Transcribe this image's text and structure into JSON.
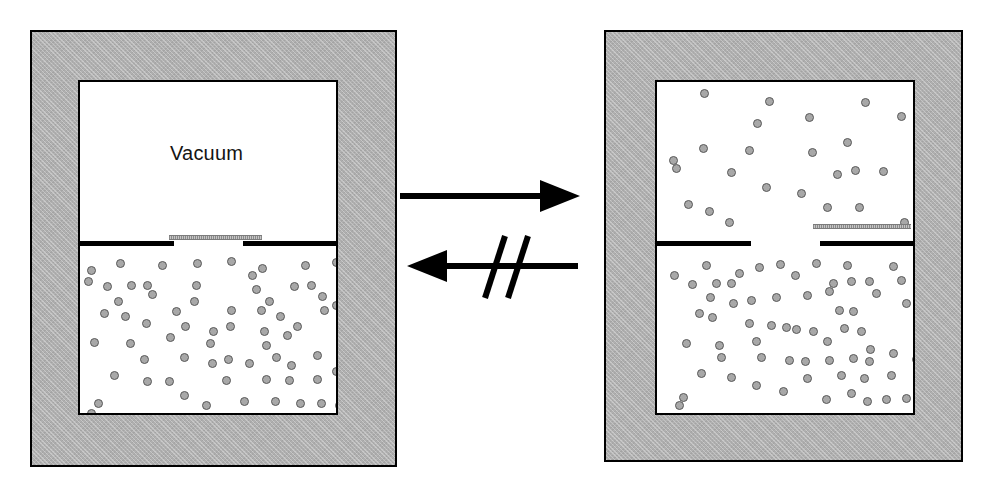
{
  "figure": {
    "width": 992,
    "height": 497,
    "background": "#ffffff"
  },
  "colors": {
    "wall_fill": "#b2b2b2",
    "wall_stroke": "#000000",
    "cavity_fill": "#ffffff",
    "particle_fill": "#a8a8a8",
    "particle_stroke": "#595959",
    "shutter_fill": "#9a9a9a",
    "partition_stroke": "#000000",
    "arrow_color": "#000000",
    "label_color": "#141414"
  },
  "panels": [
    {
      "id": "before",
      "name": "initial-state-vessel",
      "frame": {
        "x": 30,
        "y": 30,
        "w": 367,
        "h": 437
      },
      "cavity": {
        "x": 78,
        "y": 80,
        "w": 260,
        "h": 335
      },
      "partition": {
        "y": 241,
        "left_segment": {
          "x": 78,
          "w": 96
        },
        "right_segment": {
          "x": 243,
          "w": 95
        },
        "gap": {
          "x": 174,
          "w": 69
        }
      },
      "shutter": {
        "x": 169,
        "y": 235,
        "w": 93,
        "state": "closed"
      },
      "upper_chamber": {
        "label": "Vacuum",
        "particle_count": 0
      },
      "lower_chamber": {
        "label": "",
        "particle_count": 66
      },
      "label": {
        "text": "Vacuum",
        "x": 168,
        "y": 140
      }
    },
    {
      "id": "after",
      "name": "final-state-vessel",
      "frame": {
        "x": 604,
        "y": 30,
        "w": 359,
        "h": 432
      },
      "cavity": {
        "x": 655,
        "y": 80,
        "w": 260,
        "h": 335
      },
      "partition": {
        "y": 241,
        "left_segment": {
          "x": 655,
          "w": 96
        },
        "right_segment": {
          "x": 820,
          "w": 95
        },
        "gap": {
          "x": 751,
          "w": 69
        }
      },
      "shutter": {
        "x": 813,
        "y": 224,
        "w": 98,
        "state": "open"
      },
      "upper_chamber": {
        "label": "",
        "particle_count": 25
      },
      "lower_chamber": {
        "label": "",
        "particle_count": 65
      }
    }
  ],
  "arrows": {
    "forward": {
      "name": "forward-process-arrow",
      "label": "",
      "direction": "right",
      "meaning": "spontaneous free expansion"
    },
    "reverse": {
      "name": "reverse-process-arrow",
      "label": "",
      "direction": "left",
      "crossed_out": true,
      "slash_count": 2,
      "meaning": "reverse process does not occur spontaneously"
    }
  },
  "particles": {
    "before_lower": [
      [
        7,
        17
      ],
      [
        36,
        10
      ],
      [
        78,
        12
      ],
      [
        113,
        10
      ],
      [
        147,
        8
      ],
      [
        178,
        15
      ],
      [
        185,
        48
      ],
      [
        221,
        12
      ],
      [
        252,
        9
      ],
      [
        4,
        28
      ],
      [
        23,
        33
      ],
      [
        47,
        32
      ],
      [
        63,
        32
      ],
      [
        112,
        32
      ],
      [
        168,
        22
      ],
      [
        210,
        33
      ],
      [
        227,
        32
      ],
      [
        238,
        43
      ],
      [
        34,
        48
      ],
      [
        20,
        60
      ],
      [
        41,
        63
      ],
      [
        68,
        41
      ],
      [
        110,
        48
      ],
      [
        147,
        57
      ],
      [
        177,
        57
      ],
      [
        196,
        63
      ],
      [
        240,
        57
      ],
      [
        62,
        70
      ],
      [
        101,
        73
      ],
      [
        129,
        78
      ],
      [
        146,
        73
      ],
      [
        180,
        78
      ],
      [
        213,
        73
      ],
      [
        252,
        52
      ],
      [
        86,
        84
      ],
      [
        126,
        90
      ],
      [
        182,
        92
      ],
      [
        203,
        82
      ],
      [
        10,
        89
      ],
      [
        46,
        90
      ],
      [
        100,
        104
      ],
      [
        128,
        110
      ],
      [
        144,
        106
      ],
      [
        165,
        110
      ],
      [
        192,
        104
      ],
      [
        207,
        112
      ],
      [
        233,
        102
      ],
      [
        30,
        122
      ],
      [
        63,
        128
      ],
      [
        85,
        128
      ],
      [
        142,
        127
      ],
      [
        182,
        126
      ],
      [
        205,
        127
      ],
      [
        233,
        126
      ],
      [
        14,
        150
      ],
      [
        100,
        142
      ],
      [
        122,
        152
      ],
      [
        160,
        148
      ],
      [
        191,
        148
      ],
      [
        216,
        150
      ],
      [
        237,
        150
      ],
      [
        255,
        152
      ],
      [
        7,
        160
      ],
      [
        252,
        118
      ],
      [
        60,
        106
      ],
      [
        172,
        36
      ],
      [
        92,
        58
      ],
      [
        258,
        85
      ]
    ],
    "before_upper": [],
    "after_upper": [
      [
        43,
        3
      ],
      [
        108,
        11
      ],
      [
        204,
        12
      ],
      [
        240,
        26
      ],
      [
        96,
        33
      ],
      [
        148,
        27
      ],
      [
        262,
        22
      ],
      [
        42,
        58
      ],
      [
        151,
        62
      ],
      [
        186,
        52
      ],
      [
        88,
        60
      ],
      [
        15,
        78
      ],
      [
        70,
        82
      ],
      [
        176,
        84
      ],
      [
        194,
        80
      ],
      [
        222,
        81
      ],
      [
        105,
        97
      ],
      [
        140,
        103
      ],
      [
        27,
        114
      ],
      [
        48,
        121
      ],
      [
        68,
        132
      ],
      [
        166,
        117
      ],
      [
        198,
        117
      ],
      [
        243,
        132
      ],
      [
        12,
        70
      ]
    ],
    "after_lower": [
      [
        13,
        22
      ],
      [
        31,
        31
      ],
      [
        45,
        12
      ],
      [
        55,
        30
      ],
      [
        70,
        30
      ],
      [
        78,
        20
      ],
      [
        98,
        14
      ],
      [
        119,
        11
      ],
      [
        134,
        22
      ],
      [
        155,
        10
      ],
      [
        186,
        12
      ],
      [
        190,
        28
      ],
      [
        208,
        28
      ],
      [
        232,
        13
      ],
      [
        240,
        27
      ],
      [
        49,
        44
      ],
      [
        38,
        60
      ],
      [
        51,
        64
      ],
      [
        72,
        50
      ],
      [
        90,
        47
      ],
      [
        115,
        44
      ],
      [
        146,
        42
      ],
      [
        168,
        38
      ],
      [
        178,
        57
      ],
      [
        192,
        58
      ],
      [
        215,
        40
      ],
      [
        245,
        50
      ],
      [
        88,
        70
      ],
      [
        110,
        72
      ],
      [
        125,
        74
      ],
      [
        135,
        76
      ],
      [
        152,
        78
      ],
      [
        183,
        75
      ],
      [
        200,
        78
      ],
      [
        25,
        90
      ],
      [
        58,
        92
      ],
      [
        95,
        88
      ],
      [
        166,
        88
      ],
      [
        209,
        96
      ],
      [
        100,
        104
      ],
      [
        128,
        107
      ],
      [
        144,
        108
      ],
      [
        168,
        107
      ],
      [
        192,
        105
      ],
      [
        208,
        108
      ],
      [
        232,
        100
      ],
      [
        40,
        120
      ],
      [
        70,
        124
      ],
      [
        95,
        132
      ],
      [
        146,
        125
      ],
      [
        180,
        122
      ],
      [
        203,
        125
      ],
      [
        230,
        122
      ],
      [
        22,
        144
      ],
      [
        122,
        138
      ],
      [
        165,
        146
      ],
      [
        190,
        140
      ],
      [
        206,
        148
      ],
      [
        225,
        146
      ],
      [
        245,
        145
      ],
      [
        18,
        152
      ],
      [
        255,
        106
      ],
      [
        60,
        104
      ],
      [
        172,
        30
      ],
      [
        258,
        80
      ]
    ]
  }
}
